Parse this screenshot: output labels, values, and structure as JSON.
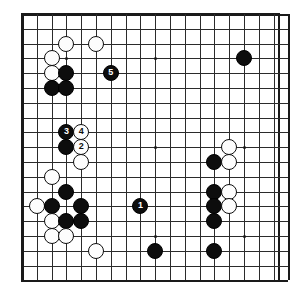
{
  "diagram": {
    "kind": "go-board-diagram",
    "title": "",
    "board": {
      "size": 19,
      "visible_columns": 19,
      "visible_rows": 19,
      "origin_px": [
        22,
        14
      ],
      "spacing_px": 14.8,
      "grid_color": "#2b2b2b",
      "border_color": "#1a1a1a",
      "background_color": "#ffffff",
      "star_points": [
        [
          3,
          3
        ],
        [
          9,
          3
        ],
        [
          15,
          3
        ],
        [
          3,
          9
        ],
        [
          9,
          9
        ],
        [
          15,
          9
        ],
        [
          3,
          15
        ],
        [
          9,
          15
        ],
        [
          15,
          15
        ]
      ]
    },
    "colors": {
      "black_stone": "#0d0d0d",
      "white_stone": "#fdfdfd",
      "black_label_text": "#ffffff",
      "white_label_text": "#0d0d0d"
    },
    "stones": [
      {
        "color": "white",
        "col": 3,
        "row": 2,
        "label": ""
      },
      {
        "color": "white",
        "col": 5,
        "row": 2,
        "label": ""
      },
      {
        "color": "white",
        "col": 2,
        "row": 3,
        "label": ""
      },
      {
        "color": "white",
        "col": 2,
        "row": 4,
        "label": ""
      },
      {
        "color": "black",
        "col": 3,
        "row": 4,
        "label": ""
      },
      {
        "color": "black",
        "col": 2,
        "row": 5,
        "label": ""
      },
      {
        "color": "black",
        "col": 3,
        "row": 5,
        "label": ""
      },
      {
        "color": "black",
        "col": 6,
        "row": 4,
        "label": "5"
      },
      {
        "color": "black",
        "col": 15,
        "row": 3,
        "label": ""
      },
      {
        "color": "black",
        "col": 3,
        "row": 8,
        "label": "3"
      },
      {
        "color": "white",
        "col": 4,
        "row": 8,
        "label": "4"
      },
      {
        "color": "black",
        "col": 3,
        "row": 9,
        "label": ""
      },
      {
        "color": "white",
        "col": 4,
        "row": 9,
        "label": "2"
      },
      {
        "color": "white",
        "col": 4,
        "row": 10,
        "label": ""
      },
      {
        "color": "white",
        "col": 14,
        "row": 9,
        "label": ""
      },
      {
        "color": "black",
        "col": 13,
        "row": 10,
        "label": ""
      },
      {
        "color": "white",
        "col": 14,
        "row": 10,
        "label": ""
      },
      {
        "color": "white",
        "col": 2,
        "row": 11,
        "label": ""
      },
      {
        "color": "black",
        "col": 3,
        "row": 12,
        "label": ""
      },
      {
        "color": "black",
        "col": 13,
        "row": 12,
        "label": ""
      },
      {
        "color": "white",
        "col": 14,
        "row": 12,
        "label": ""
      },
      {
        "color": "white",
        "col": 1,
        "row": 13,
        "label": ""
      },
      {
        "color": "black",
        "col": 2,
        "row": 13,
        "label": ""
      },
      {
        "color": "black",
        "col": 4,
        "row": 13,
        "label": ""
      },
      {
        "color": "black",
        "col": 8,
        "row": 13,
        "label": "1"
      },
      {
        "color": "black",
        "col": 13,
        "row": 13,
        "label": ""
      },
      {
        "color": "white",
        "col": 14,
        "row": 13,
        "label": ""
      },
      {
        "color": "white",
        "col": 2,
        "row": 14,
        "label": ""
      },
      {
        "color": "black",
        "col": 3,
        "row": 14,
        "label": ""
      },
      {
        "color": "black",
        "col": 4,
        "row": 14,
        "label": ""
      },
      {
        "color": "black",
        "col": 13,
        "row": 14,
        "label": ""
      },
      {
        "color": "white",
        "col": 2,
        "row": 15,
        "label": ""
      },
      {
        "color": "white",
        "col": 3,
        "row": 15,
        "label": ""
      },
      {
        "color": "white",
        "col": 5,
        "row": 16,
        "label": ""
      },
      {
        "color": "black",
        "col": 9,
        "row": 16,
        "label": ""
      },
      {
        "color": "black",
        "col": 13,
        "row": 16,
        "label": ""
      }
    ],
    "move_sequence": [
      {
        "label": "1",
        "color": "black"
      },
      {
        "label": "2",
        "color": "white"
      },
      {
        "label": "3",
        "color": "black"
      },
      {
        "label": "4",
        "color": "white"
      },
      {
        "label": "5",
        "color": "black"
      }
    ]
  }
}
